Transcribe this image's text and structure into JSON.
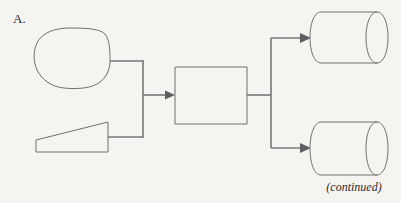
{
  "figure": {
    "panel_label": "A.",
    "continued_note": "(continued)",
    "background_color": "#f6f4f0",
    "shape_stroke_color": "#6e6e72",
    "connector_color": "#77777b",
    "arrow_color": "#5e5e62",
    "text_color": "#2b2b2b"
  },
  "nodes": [
    {
      "id": "input-oval",
      "shape_name": "rounded-oval",
      "label": "",
      "x": 35,
      "y": 28,
      "width": 75,
      "height": 60
    },
    {
      "id": "input-trapezoid",
      "shape_name": "trapezoid",
      "label": "",
      "x": 36,
      "y": 122,
      "width": 72,
      "height": 30
    },
    {
      "id": "process-box",
      "shape_name": "rectangle",
      "label": "",
      "x": 175,
      "y": 67,
      "width": 72,
      "height": 57
    },
    {
      "id": "output-cylinder-top",
      "shape_name": "cylinder",
      "label": "",
      "x": 310,
      "y": 12,
      "width": 78,
      "height": 51
    },
    {
      "id": "output-cylinder-bottom",
      "shape_name": "cylinder",
      "label": "",
      "x": 310,
      "y": 122,
      "width": 78,
      "height": 53
    }
  ],
  "edges": [
    {
      "id": "edge-oval-to-bus",
      "from": "input-oval",
      "to": "merge-bus",
      "arrow": false,
      "path": "M 110 61 L 143 61"
    },
    {
      "id": "edge-trapezoid-to-bus",
      "from": "input-trapezoid",
      "to": "merge-bus",
      "arrow": false,
      "path": "M 108 137 L 143 137"
    },
    {
      "id": "edge-merge-bus",
      "from": "merge-bus",
      "to": "merge-bus",
      "arrow": false,
      "path": "M 143 60 L 143 138"
    },
    {
      "id": "edge-bus-to-process",
      "from": "merge-bus",
      "to": "process-box",
      "arrow": true,
      "path": "M 143 95 L 170 95"
    },
    {
      "id": "edge-process-to-split",
      "from": "process-box",
      "to": "split-bus",
      "arrow": false,
      "path": "M 247 95 L 271 95"
    },
    {
      "id": "edge-split-bus",
      "from": "split-bus",
      "to": "split-bus",
      "arrow": false,
      "path": "M 271 38 L 271 148"
    },
    {
      "id": "edge-split-to-cylinder-top",
      "from": "split-bus",
      "to": "output-cylinder-top",
      "arrow": true,
      "path": "M 271 38 L 305 38"
    },
    {
      "id": "edge-split-to-cylinder-bottom",
      "from": "split-bus",
      "to": "output-cylinder-bottom",
      "arrow": true,
      "path": "M 271 148 L 305 148"
    }
  ]
}
